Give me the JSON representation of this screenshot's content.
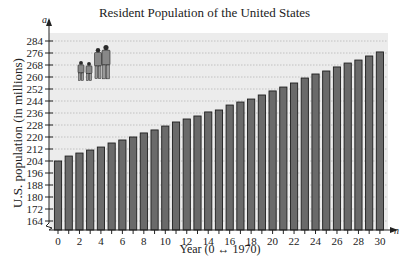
{
  "chart_data": {
    "type": "bar",
    "title": "Resident Population of the United States",
    "xlabel": "Year (0 ↔ 1970)",
    "ylabel": "U.S. population (in millions)",
    "y_axis_variable": "a",
    "y_axis_variable_subscript": "n",
    "x_axis_variable": "n",
    "categories": [
      0,
      1,
      2,
      3,
      4,
      5,
      6,
      7,
      8,
      9,
      10,
      11,
      12,
      13,
      14,
      15,
      16,
      17,
      18,
      19,
      20,
      21,
      22,
      23,
      24,
      25,
      26,
      27,
      28,
      29,
      30
    ],
    "values": [
      204.0,
      207.3,
      209.3,
      211.3,
      213.3,
      216.0,
      218.0,
      220.0,
      222.7,
      224.7,
      227.3,
      230.0,
      232.0,
      234.0,
      236.7,
      238.0,
      241.3,
      243.3,
      245.3,
      248.0,
      250.7,
      253.3,
      256.0,
      259.3,
      262.0,
      264.0,
      266.7,
      269.3,
      271.3,
      274.0,
      276.7
    ],
    "x_tick_labels": [
      "0",
      "2",
      "4",
      "6",
      "8",
      "10",
      "12",
      "14",
      "16",
      "18",
      "20",
      "22",
      "24",
      "26",
      "28",
      "30"
    ],
    "y_tick_labels": [
      "164",
      "172",
      "180",
      "188",
      "196",
      "204",
      "212",
      "220",
      "228",
      "236",
      "244",
      "252",
      "260",
      "268",
      "276",
      "284"
    ],
    "ylim": [
      156,
      290
    ],
    "y_axis_break": true,
    "grid": "horizontal dotted",
    "legend": null,
    "annotation": "family illustration (two adults, two children)",
    "colors": {
      "bar": "#6a6a6a",
      "bar_edge": "#1e1e1e",
      "plot_bg": "#ececec",
      "grid": "#b8b8b8"
    }
  }
}
